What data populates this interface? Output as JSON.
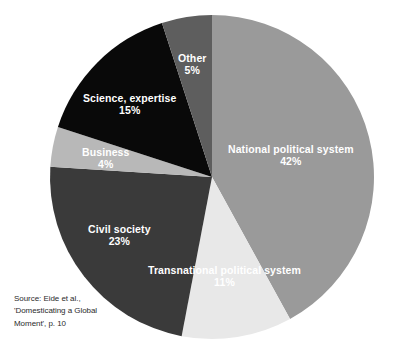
{
  "chart_data": {
    "type": "pie",
    "title": "",
    "categories": [
      "National political system",
      "Transnational political system",
      "Civil society",
      "Business",
      "Science, expertise",
      "Other"
    ],
    "values": [
      42,
      11,
      23,
      4,
      15,
      5
    ],
    "value_suffix": "%",
    "start_angle_deg": 0,
    "direction": "clockwise",
    "legend": "none",
    "grid": false,
    "slices": [
      {
        "label": "National political system",
        "value": 42,
        "value_text": "42%",
        "color": "#9a9a9a",
        "label_color": "#ffffff",
        "start_deg": 0,
        "end_deg": 151.2
      },
      {
        "label": "Transnational political system",
        "value": 11,
        "value_text": "11%",
        "color": "#e8e8e8",
        "label_color": "#ffffff",
        "start_deg": 151.2,
        "end_deg": 190.8
      },
      {
        "label": "Civil society",
        "value": 23,
        "value_text": "23%",
        "color": "#3a3a3a",
        "label_color": "#ffffff",
        "start_deg": 190.8,
        "end_deg": 273.6
      },
      {
        "label": "Business",
        "value": 4,
        "value_text": "4%",
        "color": "#b8b8b8",
        "label_color": "#ffffff",
        "start_deg": 273.6,
        "end_deg": 288.0
      },
      {
        "label": "Science, expertise",
        "value": 15,
        "value_text": "15%",
        "color": "#090909",
        "label_color": "#ffffff",
        "start_deg": 288.0,
        "end_deg": 342.0
      },
      {
        "label": "Other",
        "value": 5,
        "value_text": "5%",
        "color": "#5e5e5e",
        "label_color": "#ffffff",
        "start_deg": 342.0,
        "end_deg": 360.0
      }
    ],
    "geometry": {
      "cx": 212,
      "cy": 177,
      "r": 162
    }
  },
  "labels": {
    "national": {
      "name": "National political system",
      "value": "42%"
    },
    "transnational": {
      "name": "Transnational political system",
      "value": "11%"
    },
    "civil": {
      "name": "Civil society",
      "value": "23%"
    },
    "business": {
      "name": "Business",
      "value": "4%"
    },
    "science": {
      "name": "Science, expertise",
      "value": "15%"
    },
    "other": {
      "name": "Other",
      "value": "5%"
    }
  },
  "source_note": {
    "line1": "Source: Eide et al.,",
    "line2": "'Domesticating a Global",
    "line3": "Moment', p. 10"
  },
  "caption": {
    "text": ""
  }
}
